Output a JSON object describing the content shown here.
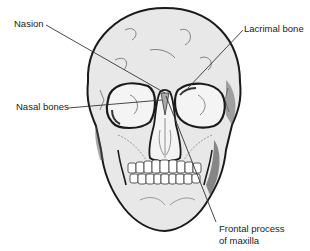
{
  "diagram": {
    "colors": {
      "bone_fill": "#e8e8e8",
      "outline": "#1a1a1a",
      "line": "#333333",
      "background": "#ffffff"
    },
    "labels": [
      {
        "id": "nasion",
        "text": "Nasion",
        "x": 14,
        "y": 18
      },
      {
        "id": "lacrimal-bone",
        "text": "Lacrimal bone",
        "x": 244,
        "y": 23
      },
      {
        "id": "nasal-bones",
        "text": "Nasal bones",
        "x": 16,
        "y": 101
      },
      {
        "id": "frontal-process-line1",
        "text": "Frontal process",
        "x": 219,
        "y": 223
      },
      {
        "id": "frontal-process-line2",
        "text": "of maxilla",
        "x": 219,
        "y": 235
      }
    ]
  }
}
